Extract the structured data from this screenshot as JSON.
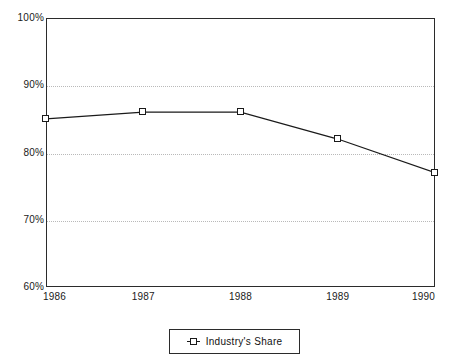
{
  "chart_data": {
    "type": "line",
    "title": "",
    "subtitle": "",
    "xlabel": "",
    "ylabel": "",
    "categories": [
      "1986",
      "1987",
      "1988",
      "1989",
      "1990"
    ],
    "series": [
      {
        "name": "Industry's Share",
        "values": [
          85,
          86,
          86,
          82,
          77
        ],
        "marker": "square",
        "color": "#1a1a1a"
      }
    ],
    "ylim": [
      60,
      100
    ],
    "yticks": [
      60,
      70,
      80,
      90,
      100
    ],
    "ytick_labels": [
      "60%",
      "70%",
      "80%",
      "90%",
      "100%"
    ],
    "grid": "horizontal-dotted",
    "legend_position": "bottom-center"
  },
  "legend": {
    "entries": [
      {
        "label": "Industry's Share"
      }
    ]
  },
  "colors": {
    "line": "#1a1a1a",
    "axis": "#2b2b2b",
    "grid": "#b9b9b9",
    "background": "#ffffff",
    "text": "#1a1a1a"
  }
}
